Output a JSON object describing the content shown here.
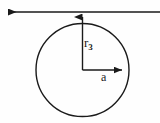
{
  "figure": {
    "type": "geometric-diagram",
    "background_color": "#fefefe",
    "stroke_color": "#1a1a1a",
    "canvas": {
      "width": 160,
      "height": 123
    }
  },
  "labels": {
    "radius_vertical": {
      "base": "r",
      "subscript": "3",
      "full": "r3"
    },
    "radius_horizontal": {
      "full": "a"
    }
  },
  "geometry": {
    "tangent_line": {
      "name": "horizontal-axis-line",
      "y": 12,
      "x_start": 4,
      "x_end": 160,
      "arrow_end": "left"
    },
    "circle": {
      "center_x": 82.5,
      "center_y": 70,
      "radius": 46.5
    },
    "vertical_arrow": {
      "x": 82.5,
      "y_start": 70,
      "y_end": 13,
      "arrow_end": "up"
    },
    "horizontal_arrow": {
      "y": 70,
      "x_start": 82.5,
      "x_end": 128,
      "arrow_end": "right"
    }
  }
}
